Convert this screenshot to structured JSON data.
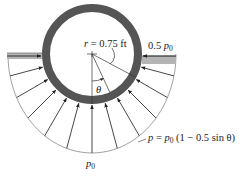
{
  "figure": {
    "labels": {
      "radius": "r = 0.75 ft",
      "right_pressure_coef": "0.5",
      "right_pressure_var": "p",
      "right_pressure_sub": "0",
      "bottom_var": "p",
      "bottom_sub": "0",
      "theta": "θ",
      "formula_lhs": "p = ",
      "formula_var": "p",
      "formula_sub": "0",
      "formula_rhs": " (1 − 0.5 sin θ)"
    },
    "geometry": {
      "center": [
        92,
        54
      ],
      "ring_outer_radius": 50,
      "ring_thickness": 8,
      "envelope_half_width": 84,
      "envelope_depth": 99,
      "arrow_angles_deg": [
        -75,
        -60,
        -45,
        -30,
        -15,
        0,
        15,
        30,
        45,
        60,
        75
      ],
      "theta_line_angle_deg": 25,
      "radius_line_angle_deg": 62
    },
    "colors": {
      "ring": "#555555",
      "bar_fill": "#b4b4b4",
      "bar_edge": "#7a7a7a",
      "line": "#333333",
      "envelope": "#888888"
    }
  }
}
